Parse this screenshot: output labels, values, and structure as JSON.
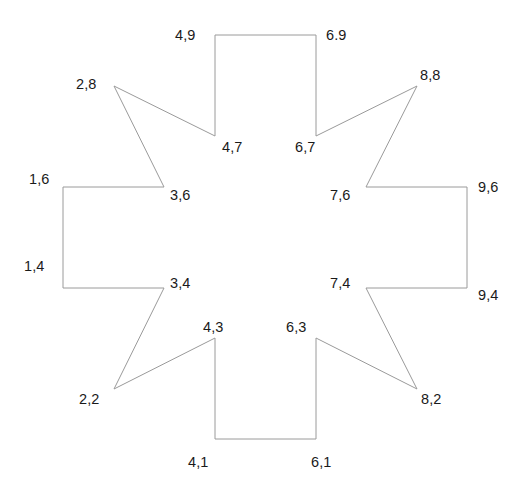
{
  "figure": {
    "type": "coordinate-polygon",
    "width": 526,
    "height": 496,
    "background_color": "#ffffff",
    "stroke_color": "#9a9a9a",
    "stroke_width": 1,
    "fill": "none",
    "label_color": "#1a1a1a"
  },
  "axes": {
    "x_min": 1,
    "x_max": 9,
    "y_min": 1,
    "y_max": 9,
    "x_origin_px": 63,
    "y_origin_px": 438,
    "px_per_unit_x": 50.5,
    "px_per_unit_y": 50.4,
    "visible_axis_lines": false,
    "visible_gridlines": false,
    "visible_tick_marks": false
  },
  "chart_data": {
    "type": "scatter",
    "title": "",
    "xlabel": "",
    "ylabel": "",
    "xlim": [
      1,
      9
    ],
    "ylim": [
      1,
      9
    ],
    "grid": false,
    "legend": false,
    "vertices": [
      {
        "label": "4,9",
        "x": 4,
        "y": 9,
        "px": 215,
        "py": 35,
        "label_px": 175,
        "label_py": 28,
        "kind": "outer-corner"
      },
      {
        "label": "6.9",
        "x": 6,
        "y": 9,
        "px": 316,
        "py": 35,
        "label_px": 326,
        "label_py": 28,
        "kind": "outer-corner"
      },
      {
        "label": "6,7",
        "x": 6,
        "y": 7,
        "px": 316,
        "py": 136,
        "label_px": 295,
        "label_py": 140,
        "kind": "inner-notch"
      },
      {
        "label": "8,8",
        "x": 8,
        "y": 8,
        "px": 417,
        "py": 86,
        "label_px": 420,
        "label_py": 68,
        "kind": "star-tip"
      },
      {
        "label": "7,6",
        "x": 7,
        "y": 6,
        "px": 366,
        "py": 187,
        "label_px": 330,
        "label_py": 188,
        "kind": "inner-notch"
      },
      {
        "label": "9,6",
        "x": 9,
        "y": 6,
        "px": 467,
        "py": 187,
        "label_px": 478,
        "label_py": 180,
        "kind": "outer-corner"
      },
      {
        "label": "9,4",
        "x": 9,
        "y": 4,
        "px": 467,
        "py": 288,
        "label_px": 478,
        "label_py": 288,
        "kind": "outer-corner"
      },
      {
        "label": "7,4",
        "x": 7,
        "y": 4,
        "px": 366,
        "py": 288,
        "label_px": 330,
        "label_py": 276,
        "kind": "inner-notch"
      },
      {
        "label": "8,2",
        "x": 8,
        "y": 2,
        "px": 417,
        "py": 389,
        "label_px": 421,
        "label_py": 392,
        "kind": "star-tip"
      },
      {
        "label": "6,3",
        "x": 6,
        "y": 3,
        "px": 316,
        "py": 338,
        "label_px": 286,
        "label_py": 320,
        "kind": "inner-notch"
      },
      {
        "label": "6,1",
        "x": 6,
        "y": 1,
        "px": 316,
        "py": 439,
        "label_px": 311,
        "label_py": 455,
        "kind": "outer-corner"
      },
      {
        "label": "4,1",
        "x": 4,
        "y": 1,
        "px": 215,
        "py": 439,
        "label_px": 188,
        "label_py": 455,
        "kind": "outer-corner"
      },
      {
        "label": "4,3",
        "x": 4,
        "y": 3,
        "px": 215,
        "py": 338,
        "label_px": 203,
        "label_py": 320,
        "kind": "inner-notch"
      },
      {
        "label": "2,2",
        "x": 2,
        "y": 2,
        "px": 114,
        "py": 389,
        "label_px": 79,
        "label_py": 392,
        "kind": "star-tip"
      },
      {
        "label": "3,4",
        "x": 3,
        "y": 4,
        "px": 164,
        "py": 288,
        "label_px": 170,
        "label_py": 276,
        "kind": "inner-notch"
      },
      {
        "label": "1,4",
        "x": 1,
        "y": 4,
        "px": 63,
        "py": 288,
        "label_px": 24,
        "label_py": 259,
        "kind": "outer-corner"
      },
      {
        "label": "1,6",
        "x": 1,
        "y": 6,
        "px": 63,
        "py": 187,
        "label_px": 29,
        "label_py": 172,
        "kind": "outer-corner"
      },
      {
        "label": "3,6",
        "x": 3,
        "y": 6,
        "px": 164,
        "py": 187,
        "label_px": 170,
        "label_py": 188,
        "kind": "inner-notch"
      },
      {
        "label": "2,8",
        "x": 2,
        "y": 8,
        "px": 114,
        "py": 86,
        "label_px": 76,
        "label_py": 77,
        "kind": "star-tip"
      },
      {
        "label": "4,7",
        "x": 4,
        "y": 7,
        "px": 215,
        "py": 136,
        "label_px": 222,
        "label_py": 140,
        "kind": "inner-notch"
      }
    ],
    "path_order": [
      "4,9",
      "6.9",
      "6,7",
      "8,8",
      "7,6",
      "9,6",
      "9,4",
      "7,4",
      "8,2",
      "6,3",
      "6,1",
      "4,1",
      "4,3",
      "2,2",
      "3,4",
      "1,4",
      "1,6",
      "3,6",
      "2,8",
      "4,7"
    ],
    "closed": true
  }
}
